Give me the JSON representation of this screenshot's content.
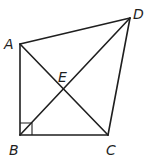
{
  "diagram": {
    "type": "quadrilateral-with-diagonals",
    "points": {
      "A": {
        "x": 20,
        "y": 44
      },
      "B": {
        "x": 20,
        "y": 135
      },
      "C": {
        "x": 108,
        "y": 135
      },
      "D": {
        "x": 130,
        "y": 18
      },
      "E": {
        "x": 63,
        "y": 89
      }
    },
    "labels": {
      "A": "A",
      "B": "B",
      "C": "C",
      "D": "D",
      "E": "E"
    },
    "edges": [
      "AB",
      "BC",
      "CD",
      "DA",
      "AC",
      "BD"
    ],
    "right_angle_at": "B",
    "line_color": "#1f1f1f"
  }
}
